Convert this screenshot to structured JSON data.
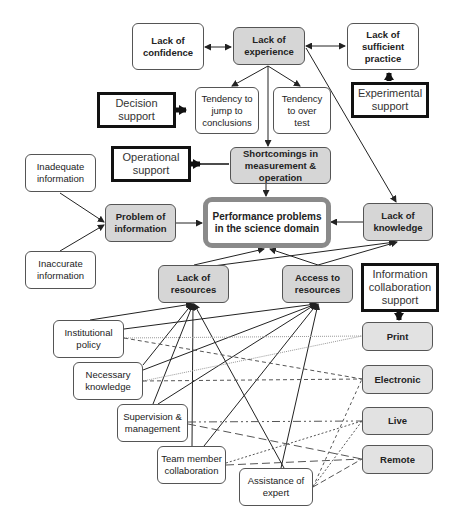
{
  "diagram": {
    "nodes": {
      "lack_of_confidence": "Lack of\nconfidence",
      "lack_of_experience": "Lack of\nexperience",
      "lack_of_sufficient_practice": "Lack of\nsufficient\npractice",
      "decision_support": "Decision\nsupport",
      "tendency_jump": "Tendency to\njump to\nconclusions",
      "tendency_over_test": "Tendency\nto over\ntest",
      "experimental_support": "Experimental\nsupport",
      "operational_support": "Operational\nsupport",
      "shortcomings": "Shortcomings in\nmeasurement & operation",
      "inadequate_information": "Inadequate\ninformation",
      "problem_of_information": "Problem of\ninformation",
      "performance_problems": "Performance problems\nin the science domain",
      "lack_of_knowledge": "Lack of\nknowledge",
      "inaccurate_information": "Inaccurate\ninformation",
      "lack_of_resources": "Lack of\nresources",
      "access_to_resources": "Access to\nresources",
      "info_collab_support": "Information\ncollaboration\nsupport",
      "institutional_policy": "Institutional\npolicy",
      "print": "Print",
      "necessary_knowledge": "Necessary\nknowledge",
      "electronic": "Electronic",
      "supervision_management": "Supervision &\nmanagement",
      "live": "Live",
      "team_member_collaboration": "Team member\ncollaboration",
      "remote": "Remote",
      "assistance_of_expert": "Assistance of\nexpert"
    },
    "colors": {
      "problem_fill": "#d6d6d6",
      "channel_fill": "#e2e2e2",
      "central_border": "#8a8a8a",
      "support_border": "#111111",
      "line": "#222222"
    }
  }
}
